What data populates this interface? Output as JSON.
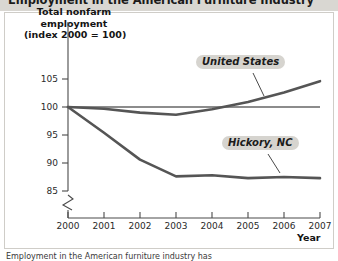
{
  "figure": {
    "title": "Employment in the American Furniture Industry",
    "caption": "Employment in the American furniture industry has"
  },
  "axes": {
    "y_title_lines": [
      "Total nonfarm",
      "employment",
      "(index 2000 = 100)"
    ],
    "x_title": "Year",
    "y_ticks": [
      "85",
      "90",
      "95",
      "100",
      "105"
    ],
    "x_ticks": [
      "2000",
      "2001",
      "2002",
      "2003",
      "2004",
      "2005",
      "2006",
      "2007"
    ],
    "axis_break_icon": "axis-break-zigzag"
  },
  "series_labels": {
    "united_states": "United States",
    "hickory": "Hickory, NC"
  },
  "colors": {
    "line": "#555555",
    "baseline": "#1a1a1a",
    "label_box": "#d6d4cf",
    "title_band": "#d9d7d2",
    "panel_border": "#cfcdc8"
  },
  "chart_data": {
    "type": "line",
    "title": "Employment in the American Furniture Industry",
    "xlabel": "Year",
    "ylabel": "Total nonfarm employment (index 2000 = 100)",
    "x": [
      2000,
      2001,
      2002,
      2003,
      2004,
      2005,
      2006,
      2007
    ],
    "xlim": [
      2000,
      2007
    ],
    "ylim": [
      85,
      106
    ],
    "yticks": [
      85,
      90,
      95,
      100,
      105
    ],
    "y_axis_broken": true,
    "grid": false,
    "legend": "inline-callouts",
    "reference_line": {
      "value": 100,
      "label": "index = 100"
    },
    "series": [
      {
        "name": "United States",
        "values": [
          100.0,
          99.7,
          99.0,
          98.6,
          99.6,
          100.9,
          102.6,
          104.6
        ]
      },
      {
        "name": "Hickory, NC",
        "values": [
          100.0,
          95.4,
          90.6,
          87.6,
          87.8,
          87.3,
          87.5,
          87.3
        ]
      }
    ]
  }
}
